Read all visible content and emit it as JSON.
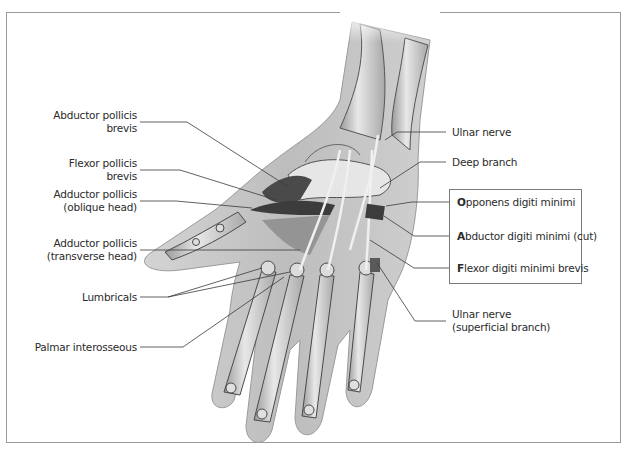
{
  "diagram": {
    "left_labels": [
      {
        "lines": [
          "Abductor pollicis",
          "brevis"
        ]
      },
      {
        "lines": [
          "Flexor pollicis",
          "brevis"
        ]
      },
      {
        "lines": [
          "Adductor pollicis",
          "(oblique head)"
        ]
      },
      {
        "lines": [
          "Adductor pollicis",
          "(transverse head)"
        ]
      },
      {
        "lines": [
          "Lumbricals"
        ]
      },
      {
        "lines": [
          "Palmar interosseous"
        ]
      }
    ],
    "right_labels": [
      {
        "lines": [
          "Ulnar nerve"
        ]
      },
      {
        "lines": [
          "Deep branch"
        ]
      },
      {
        "lines": [
          "Ulnar nerve",
          "(superficial branch)"
        ]
      }
    ],
    "boxed_labels": [
      {
        "initial": "O",
        "rest": "pponens digiti minimi"
      },
      {
        "initial": "A",
        "rest": "bductor digiti minimi (cut)"
      },
      {
        "initial": "F",
        "rest": "lexor digiti minimi brevis"
      }
    ],
    "colors": {
      "frame": "#9a9a9a",
      "leader_line": "#3a3a3a",
      "skin_silhouette": "#c9c9c9",
      "bone_fill": "#dedede",
      "bone_outline": "#4a4a4a",
      "muscle_dark": "#3c3c3c",
      "nerve": "#f2f2f2"
    }
  }
}
